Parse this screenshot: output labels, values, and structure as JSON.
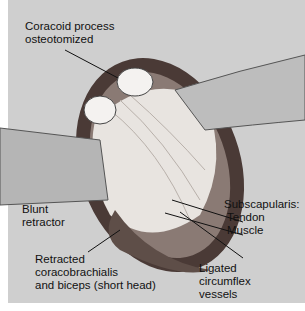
{
  "illustration": {
    "subject": "Surgical exposure of shoulder: coracoid osteotomy with retracted muscles",
    "labels": {
      "coracoid": [
        "Coracoid process",
        "osteotomized"
      ],
      "blunt": [
        "Blunt",
        "retractor"
      ],
      "subscap": [
        "Subscapularis:",
        "Tendon",
        "Muscle"
      ],
      "retracted": [
        "Retracted",
        "coracobrachialis",
        "and biceps (short head)"
      ],
      "ligated": [
        "Ligated",
        "circumflex",
        "vessels"
      ]
    }
  }
}
